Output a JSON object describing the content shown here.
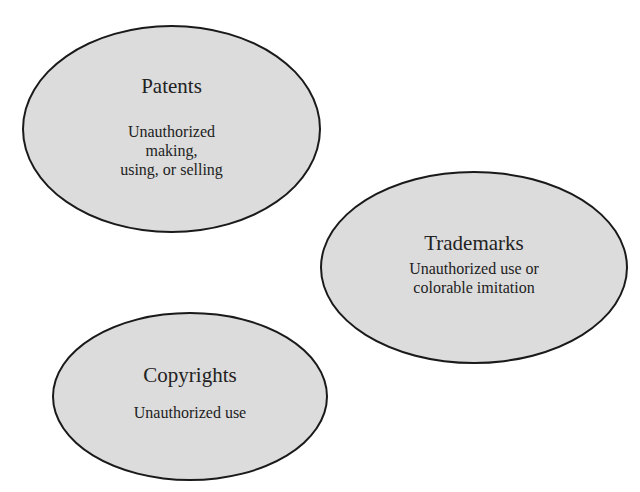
{
  "diagram": {
    "fill_color": "#dcdcdc",
    "stroke_color": "#1a1a1a",
    "nodes": [
      {
        "id": "patents",
        "title": "Patents",
        "description": "Unauthorized\nmaking,\nusing, or selling"
      },
      {
        "id": "trademarks",
        "title": "Trademarks",
        "description": "Unauthorized use or\ncolorable imitation"
      },
      {
        "id": "copyrights",
        "title": "Copyrights",
        "description": "Unauthorized use"
      }
    ]
  }
}
